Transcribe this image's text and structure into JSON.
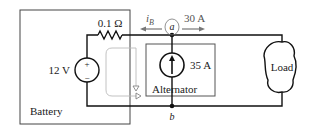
{
  "diagram": {
    "type": "circuit",
    "battery": {
      "label": "Battery",
      "voltage_label": "12 V",
      "plus": "+",
      "minus": "−",
      "resistor_label": "0.1 Ω"
    },
    "alternator": {
      "label": "Alternator",
      "current_label": "35 A"
    },
    "load": {
      "label": "Load"
    },
    "nodes": {
      "a": "a",
      "b": "b"
    },
    "currents": {
      "battery_current": "i",
      "battery_current_sub": "B",
      "load_current": "30 A"
    }
  }
}
